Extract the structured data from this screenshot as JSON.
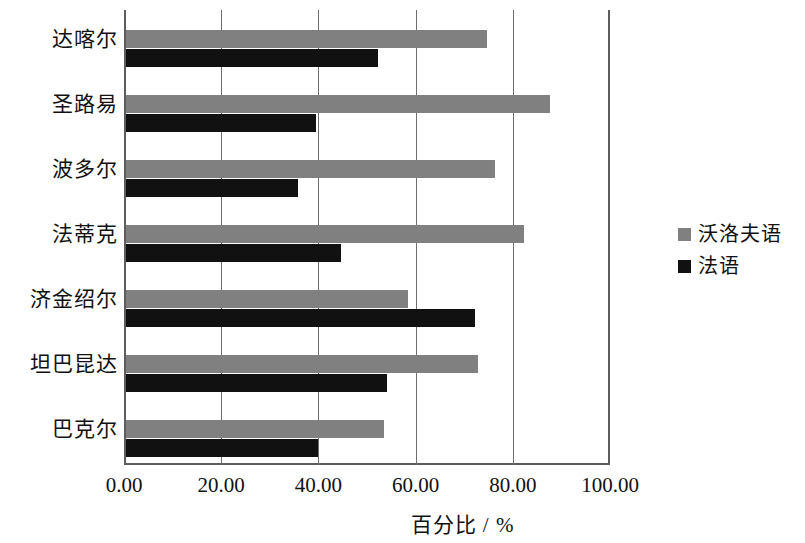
{
  "chart_data": {
    "type": "bar",
    "orientation": "horizontal",
    "title": "",
    "xlabel": "百分比 / %",
    "ylabel": "",
    "xlim": [
      0,
      100
    ],
    "xticks": [
      "0.00",
      "20.00",
      "40.00",
      "60.00",
      "80.00",
      "100.00"
    ],
    "xtick_values": [
      0,
      20,
      40,
      60,
      80,
      100
    ],
    "grid": "vertical",
    "legend_position": "right",
    "categories": [
      "达喀尔",
      "圣路易",
      "波多尔",
      "法蒂克",
      "济金绍尔",
      "坦巴昆达",
      "巴克尔"
    ],
    "series": [
      {
        "name": "沃洛夫语",
        "color": "#808080",
        "values": [
          74.3,
          87.2,
          75.9,
          81.9,
          58.0,
          72.4,
          53.1
        ]
      },
      {
        "name": "法语",
        "color": "#111111",
        "values": [
          51.9,
          39.1,
          35.4,
          44.2,
          71.8,
          53.7,
          39.5
        ]
      }
    ]
  }
}
